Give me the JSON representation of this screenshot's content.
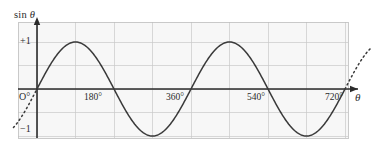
{
  "chart_data": {
    "type": "line",
    "title": "",
    "subtitle": "",
    "ylabel": "sin θ",
    "xlabel": "θ",
    "function": "y = sin(θ)",
    "xlim": [
      -60,
      780
    ],
    "ylim": [
      -1.35,
      1.35
    ],
    "grid": true,
    "grid_x_step_deg": 90,
    "grid_y_step": 0.5,
    "legend": "none",
    "x_ticks": [
      {
        "value": 0,
        "label": "O°"
      },
      {
        "value": 180,
        "label": "180°"
      },
      {
        "value": 360,
        "label": "360°"
      },
      {
        "value": 540,
        "label": "540°"
      },
      {
        "value": 720,
        "label": "720°"
      }
    ],
    "y_ticks": [
      {
        "value": 1,
        "label": "+1"
      },
      {
        "value": -1,
        "label": "−1"
      }
    ],
    "series": [
      {
        "name": "sin θ",
        "style": "solid",
        "color": "#3a3a3a",
        "x": [
          0,
          30,
          60,
          90,
          120,
          150,
          180,
          210,
          240,
          270,
          300,
          330,
          360,
          390,
          420,
          450,
          480,
          510,
          540,
          570,
          600,
          630,
          660,
          690,
          720
        ],
        "values": [
          0,
          0.5,
          0.87,
          1,
          0.87,
          0.5,
          0,
          -0.5,
          -0.87,
          -1,
          -0.87,
          -0.5,
          0,
          0.5,
          0.87,
          1,
          0.87,
          0.5,
          0,
          -0.5,
          -0.87,
          -1,
          -0.87,
          -0.5,
          0
        ]
      },
      {
        "name": "extension-left",
        "style": "dotted",
        "color": "#3a3a3a",
        "x": [
          -55,
          -45,
          -30,
          -15,
          0
        ],
        "values": [
          -0.82,
          -0.71,
          -0.5,
          -0.26,
          0
        ]
      },
      {
        "name": "extension-right",
        "style": "dotted",
        "color": "#3a3a3a",
        "x": [
          720,
          735,
          750,
          765,
          780
        ],
        "values": [
          0,
          0.26,
          0.5,
          0.71,
          0.82
        ]
      }
    ],
    "colors": {
      "curve": "#3a3a3a",
      "axis": "#2b2b2b",
      "grid": "#c9c9c9",
      "plot_background": "#f7f7f7",
      "page_background": "#ffffff",
      "text": "#2b2b2b"
    },
    "annotations": [
      {
        "text": "curve extends beyond 720° as dotted line"
      },
      {
        "text": "curve extends before 0° as dotted line"
      }
    ]
  },
  "axis_labels": {
    "y_prefix": "sin",
    "y_symbol": "θ",
    "x_symbol": "θ",
    "plus_one": "+1",
    "minus_one": "−1",
    "origin": "O°"
  },
  "tick_labels": {
    "t180": "180°",
    "t360": "360°",
    "t540": "540°",
    "t720": "720°"
  }
}
